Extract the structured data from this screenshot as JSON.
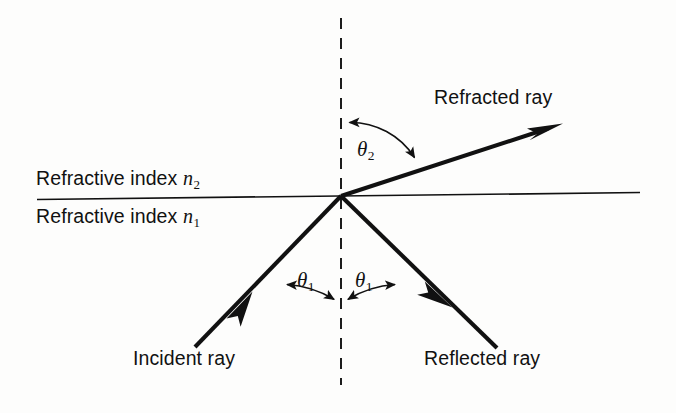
{
  "figure": {
    "background_color": "#fdfdfc",
    "ink_color": "#111111"
  },
  "labels": {
    "refracted_ray": "Refracted ray",
    "incident_ray": "Incident ray",
    "reflected_ray": "Reflected ray",
    "refractive_index_upper_text": "Refractive index ",
    "refractive_index_upper_symbol": "n",
    "refractive_index_upper_subscript": "2",
    "refractive_index_lower_text": "Refractive index ",
    "refractive_index_lower_symbol": "n",
    "refractive_index_lower_subscript": "1",
    "theta_symbol": "θ",
    "theta_2_subscript": "2",
    "theta_1_left_subscript": "1",
    "theta_1_right_subscript": "1"
  },
  "geometry": {
    "origin": {
      "x": 341,
      "y": 196
    },
    "interface_line": {
      "x1": 37,
      "y1": 199,
      "x2": 640,
      "y2": 192
    },
    "normal_line": {
      "x": 341,
      "y_top": 18,
      "y_bottom": 385,
      "style": "dashed"
    },
    "refracted_ray": {
      "x1": 341,
      "y1": 196,
      "x2": 562,
      "y2": 124,
      "arrow": "end"
    },
    "incident_ray": {
      "x1": 195,
      "y1": 347,
      "x2": 341,
      "y2": 196,
      "arrow": "midpoint"
    },
    "reflected_ray": {
      "x1": 341,
      "y1": 196,
      "x2": 497,
      "y2": 348,
      "arrow": "midpoint"
    },
    "angle_arc_theta_2": {
      "radius": 76,
      "from": "normal-up",
      "to": "refracted-ray",
      "arrows": "both"
    },
    "angle_arc_theta_1_left": {
      "radius": 104,
      "from": "incident-ray",
      "to": "normal-down",
      "arrows": "both"
    },
    "angle_arc_theta_1_right": {
      "radius": 104,
      "from": "normal-down",
      "to": "reflected-ray",
      "arrows": "both"
    }
  }
}
